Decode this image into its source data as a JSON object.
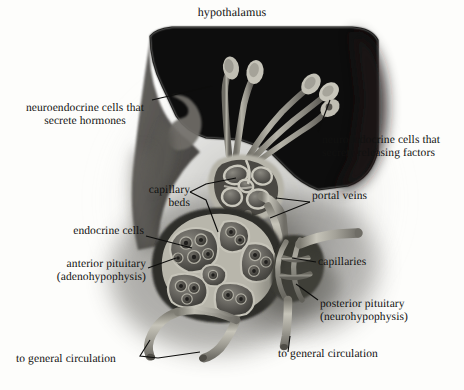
{
  "figure": {
    "title": "hypothalamus",
    "palette": {
      "background": "#fdfdfb",
      "hypothalamus_dark": "#100f0d",
      "brain_mid_gray": "#4a4a48",
      "tissue_gray": "#6d6d6a",
      "vessel_light": "#b9b7ad",
      "vessel_mid": "#8f8d84",
      "cell_dark": "#3a3a38",
      "label_text": "#111110",
      "leader_line": "#0d0d0c"
    },
    "labels": {
      "neuroendocrine_hormones": "neuroendocrine cells that\nsecrete hormones",
      "neuroendocrine_releasing": "neuroendocrine cells that\nsecrete releasing factors",
      "capillary_beds": "capillary\nbeds",
      "portal_veins": "portal veins",
      "endocrine_cells": "endocrine cells",
      "capillaries": "capillaries",
      "anterior_pituitary": "anterior pituitary\n(adenohypophysis)",
      "posterior_pituitary": "posterior pituitary\n(neurohypophysis)",
      "to_general_circulation_left": "to general circulation",
      "to_general_circulation_right": "to general circulation"
    }
  }
}
